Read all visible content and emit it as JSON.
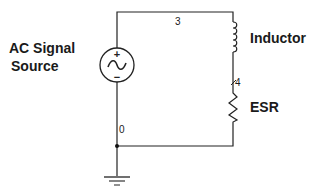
{
  "diagram": {
    "type": "circuit-schematic",
    "components": {
      "source": {
        "label_line1": "AC Signal",
        "label_line2": "Source",
        "plus": "+",
        "minus": "−"
      },
      "inductor": {
        "label": "Inductor"
      },
      "resistor": {
        "label": "ESR"
      },
      "ground": {
        "label": ""
      }
    },
    "nodes": {
      "top": "3",
      "middle": "4",
      "bottom": "0"
    },
    "colors": {
      "wire": "#222222",
      "text": "#1a1a1a",
      "background": "#ffffff"
    }
  }
}
